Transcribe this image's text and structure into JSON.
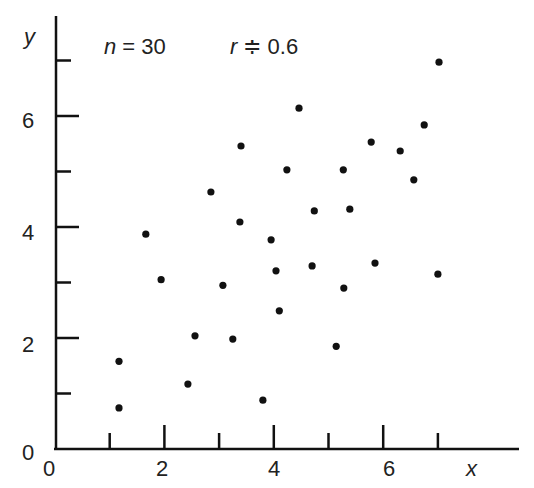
{
  "chart_data": {
    "type": "scatter",
    "title": "",
    "annotation": {
      "n_label": "n",
      "n_eq": " = 30",
      "r_label": "r",
      "r_eq": " ≑ 0.6"
    },
    "xlabel": "x",
    "ylabel": "y",
    "xlim": [
      0,
      7.8
    ],
    "ylim": [
      0,
      7.5
    ],
    "x_ticks_major": [
      0,
      2,
      4,
      6
    ],
    "x_ticks_minor": [
      1,
      3,
      5,
      7
    ],
    "y_ticks_major": [
      0,
      2,
      4,
      6
    ],
    "y_ticks_minor": [
      1,
      3,
      5,
      7
    ],
    "grid": false,
    "n": 30,
    "r": 0.6,
    "points": [
      {
        "x": 1.17,
        "y": 1.58
      },
      {
        "x": 1.17,
        "y": 0.74
      },
      {
        "x": 1.66,
        "y": 3.87
      },
      {
        "x": 1.94,
        "y": 3.05
      },
      {
        "x": 2.43,
        "y": 1.17
      },
      {
        "x": 2.56,
        "y": 2.04
      },
      {
        "x": 2.85,
        "y": 4.63
      },
      {
        "x": 3.07,
        "y": 2.95
      },
      {
        "x": 3.25,
        "y": 1.98
      },
      {
        "x": 3.38,
        "y": 4.09
      },
      {
        "x": 3.4,
        "y": 5.46
      },
      {
        "x": 3.8,
        "y": 0.88
      },
      {
        "x": 3.95,
        "y": 3.77
      },
      {
        "x": 4.04,
        "y": 3.21
      },
      {
        "x": 4.1,
        "y": 2.49
      },
      {
        "x": 4.24,
        "y": 5.03
      },
      {
        "x": 4.46,
        "y": 6.14
      },
      {
        "x": 4.7,
        "y": 3.3
      },
      {
        "x": 4.74,
        "y": 4.29
      },
      {
        "x": 5.14,
        "y": 1.85
      },
      {
        "x": 5.27,
        "y": 5.03
      },
      {
        "x": 5.28,
        "y": 2.9
      },
      {
        "x": 5.39,
        "y": 4.32
      },
      {
        "x": 5.78,
        "y": 5.53
      },
      {
        "x": 5.85,
        "y": 3.35
      },
      {
        "x": 6.31,
        "y": 5.37
      },
      {
        "x": 6.56,
        "y": 4.85
      },
      {
        "x": 6.75,
        "y": 5.84
      },
      {
        "x": 7.0,
        "y": 3.15
      },
      {
        "x": 7.02,
        "y": 6.97
      }
    ]
  },
  "labels": {
    "x_ticks": [
      "0",
      "2",
      "4",
      "6"
    ],
    "y_ticks": [
      "0",
      "2",
      "4",
      "6"
    ],
    "x_var": "x",
    "y_var": "y"
  },
  "colors": {
    "ink": "#111111",
    "background": "#ffffff"
  }
}
